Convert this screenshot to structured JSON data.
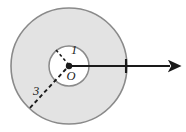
{
  "figure": {
    "type": "geometry-diagram",
    "canvas": {
      "width": 186,
      "height": 132,
      "background": "#ffffff"
    },
    "colors": {
      "annulus_fill": "#e3e3e3",
      "annulus_stroke": "#8a8a8a",
      "inner_fill": "#ffffff",
      "inner_stroke": "#8a8a8a",
      "line": "#1a1a1a",
      "dashed": "#1a1a1a",
      "label": "#1a1a1a"
    },
    "center": {
      "label": "O",
      "x": 69,
      "y": 67
    },
    "circles": [
      {
        "name": "outer-circle",
        "radius_label": "3",
        "radius_px": 58,
        "cx": 69,
        "cy": 66,
        "fill": "#e3e3e3",
        "stroke": "#8a8a8a"
      },
      {
        "name": "inner-circle",
        "radius_label": "1",
        "radius_px": 20,
        "cx": 69,
        "cy": 66,
        "fill": "#ffffff",
        "stroke": "#8a8a8a"
      }
    ],
    "radii": [
      {
        "name": "inner-radius",
        "label": "1",
        "label_x": 74,
        "label_y": 53,
        "from": {
          "x": 69,
          "y": 66
        },
        "to": {
          "x": 56,
          "y": 51
        },
        "style": "dashed"
      },
      {
        "name": "outer-radius",
        "label": "3",
        "label_x": 36,
        "label_y": 93,
        "from": {
          "x": 69,
          "y": 66
        },
        "to": {
          "x": 28,
          "y": 110
        },
        "style": "dashed"
      }
    ],
    "ray": {
      "name": "direction-ray",
      "from": {
        "x": 69,
        "y": 66
      },
      "to": {
        "x": 177,
        "y": 66
      },
      "style": "solid-arrow",
      "tick_at_x": 126
    },
    "center_dot": {
      "x": 69,
      "y": 66,
      "r": 3
    }
  }
}
